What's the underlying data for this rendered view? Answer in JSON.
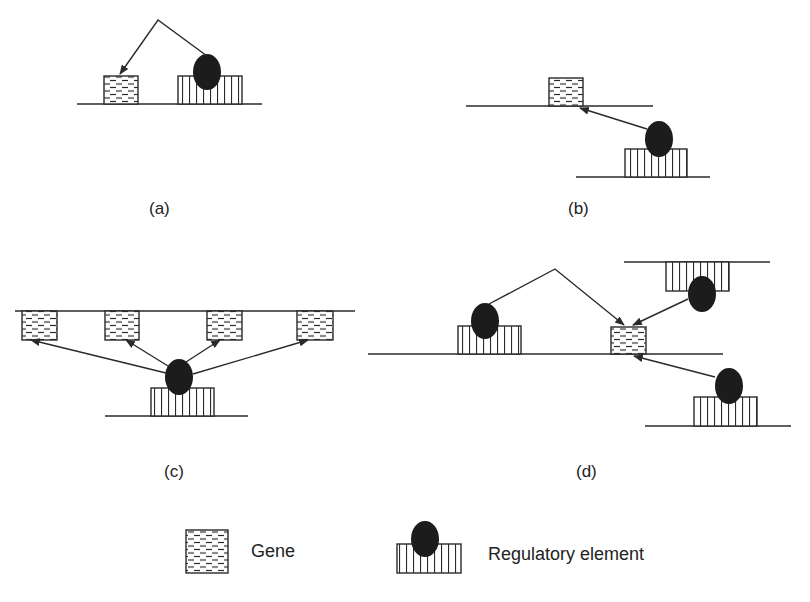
{
  "figure": {
    "panels": [
      {
        "id": "a",
        "label": "(a)",
        "description": "Regulatory element acts on a nearby gene on the same DNA strand (cis)"
      },
      {
        "id": "b",
        "label": "(b)",
        "description": "Regulatory element acts on a gene on a different DNA strand"
      },
      {
        "id": "c",
        "label": "(c)",
        "description": "One regulatory element regulates multiple genes"
      },
      {
        "id": "d",
        "label": "(d)",
        "description": "Multiple regulatory elements regulate a single gene"
      }
    ],
    "legend": {
      "gene_label": "Gene",
      "regulatory_label": "Regulatory element"
    },
    "colors": {
      "line": "#2a2a2a",
      "blob": "#1c1c1c",
      "background": "#ffffff"
    }
  }
}
